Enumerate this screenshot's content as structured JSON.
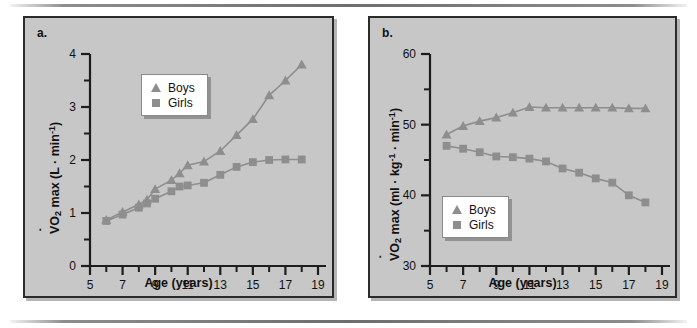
{
  "figure": {
    "background_color": "#ffffff",
    "panel_background_color": "#c7c7c7",
    "series_color": "#8e8e8e",
    "axis_color": "#1d1d1d"
  },
  "panels": [
    {
      "label": "a.",
      "legend_position": "top-left",
      "chart_ref": 0
    },
    {
      "label": "b.",
      "legend_position": "bottom-left",
      "chart_ref": 1
    }
  ],
  "chart_data": [
    {
      "type": "line",
      "title": "",
      "panel_label": "a.",
      "xlabel": "Age (years)",
      "ylabel": "V̇O2 max (L · min-1)",
      "ylabel_parts": {
        "v_dot": "V",
        "o": "O",
        "sub": "2",
        "mid": " max (L · min",
        "sup": "-1",
        "tail": ")"
      },
      "xlim": [
        5,
        19
      ],
      "ylim": [
        0,
        4
      ],
      "xticks": [
        5,
        7,
        9,
        11,
        13,
        15,
        17,
        19
      ],
      "xtick_labels": [
        "5",
        "7",
        "9",
        "11",
        "13",
        "15",
        "17",
        "19"
      ],
      "yticks": [
        0,
        1,
        2,
        3,
        4
      ],
      "ytick_labels": [
        "0",
        "1",
        "2",
        "3",
        "4"
      ],
      "yminor": [
        0.5,
        1.5,
        2.5,
        3.5
      ],
      "xminor": [
        6,
        8,
        10,
        12,
        14,
        16,
        18
      ],
      "grid": false,
      "legend": [
        "Boys",
        "Girls"
      ],
      "x": [
        6,
        7,
        8,
        8.5,
        9,
        10,
        10.5,
        11,
        12,
        13,
        14,
        15,
        16,
        17,
        18
      ],
      "series": [
        {
          "name": "Boys",
          "marker": "triangle",
          "values": [
            0.87,
            1.02,
            1.16,
            1.25,
            1.45,
            1.62,
            1.75,
            1.9,
            1.97,
            2.17,
            2.47,
            2.77,
            3.22,
            3.5,
            3.8
          ]
        },
        {
          "name": "Girls",
          "marker": "square",
          "values": [
            0.85,
            0.97,
            1.1,
            1.18,
            1.27,
            1.41,
            1.5,
            1.52,
            1.57,
            1.72,
            1.87,
            1.96,
            2.0,
            2.01,
            2.01
          ]
        }
      ]
    },
    {
      "type": "line",
      "title": "",
      "panel_label": "b.",
      "xlabel": "Age (years)",
      "ylabel": "V̇O2 max (ml · kg-1 · min-1)",
      "ylabel_parts": {
        "v_dot": "V",
        "o": "O",
        "sub": "2",
        "mid": " max (ml · kg",
        "sup": "-1",
        "mid2": " · min",
        "sup2": "-1",
        "tail": ")"
      },
      "xlim": [
        5,
        19
      ],
      "ylim": [
        30,
        60
      ],
      "xticks": [
        5,
        7,
        9,
        11,
        13,
        15,
        17,
        19
      ],
      "xtick_labels": [
        "5",
        "7",
        "9",
        "11",
        "13",
        "15",
        "17",
        "19"
      ],
      "yticks": [
        30,
        40,
        50,
        60
      ],
      "ytick_labels": [
        "30",
        "40",
        "50",
        "60"
      ],
      "yminor": [
        35,
        45,
        55
      ],
      "xminor": [
        6,
        8,
        10,
        12,
        14,
        16,
        18
      ],
      "grid": false,
      "legend": [
        "Boys",
        "Girls"
      ],
      "x": [
        6,
        7,
        8,
        9,
        10,
        11,
        12,
        13,
        14,
        15,
        16,
        17,
        18
      ],
      "series": [
        {
          "name": "Boys",
          "marker": "triangle",
          "values": [
            48.6,
            49.8,
            50.5,
            51.0,
            51.7,
            52.5,
            52.4,
            52.4,
            52.4,
            52.4,
            52.4,
            52.3,
            52.3
          ]
        },
        {
          "name": "Girls",
          "marker": "square",
          "values": [
            47.0,
            46.6,
            46.1,
            45.5,
            45.4,
            45.2,
            44.8,
            43.8,
            43.2,
            42.4,
            41.8,
            40.0,
            39.0
          ]
        }
      ]
    }
  ]
}
